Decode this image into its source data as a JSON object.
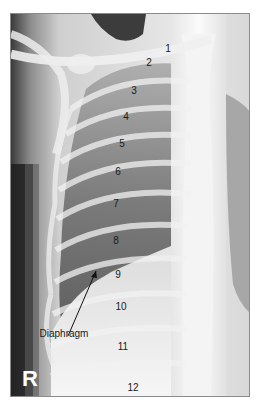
{
  "image": {
    "type": "chest-radiograph",
    "view": "right hemithorax, frontal",
    "side_marker": "R"
  },
  "rib_labels": [
    {
      "text": "1",
      "x": 157,
      "y": 35
    },
    {
      "text": "2",
      "x": 138,
      "y": 49
    },
    {
      "text": "3",
      "x": 123,
      "y": 77
    },
    {
      "text": "4",
      "x": 115,
      "y": 103
    },
    {
      "text": "5",
      "x": 111,
      "y": 130
    },
    {
      "text": "6",
      "x": 107,
      "y": 158
    },
    {
      "text": "7",
      "x": 105,
      "y": 190
    },
    {
      "text": "8",
      "x": 105,
      "y": 227
    },
    {
      "text": "9",
      "x": 107,
      "y": 261
    },
    {
      "text": "10",
      "x": 110,
      "y": 293
    },
    {
      "text": "11",
      "x": 112,
      "y": 333
    },
    {
      "text": "12",
      "x": 122,
      "y": 374
    }
  ],
  "annotations": {
    "diaphragm_label": "Diaphragm"
  },
  "colors": {
    "border": "#8a8a8a",
    "label_text": "#1a1a1a",
    "marker_text": "#ffffff"
  }
}
